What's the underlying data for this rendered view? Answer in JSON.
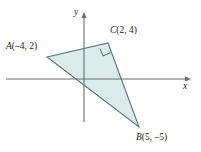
{
  "figure": {
    "kind": "coordinate-plane-triangle",
    "background_color": "#ffffff",
    "axes": {
      "x_axis_label": "x",
      "y_axis_label": "y",
      "axis_color": "#6d6e71",
      "origin_px": {
        "x": 84,
        "y": 79
      },
      "x_axis_span_px": {
        "from": 6,
        "to": 190
      },
      "y_axis_span_px": {
        "from": 13,
        "to": 122
      },
      "x_arrow": "right",
      "y_arrow": "up",
      "units_per_pixel": {
        "x": 9.25,
        "y": 9.25
      },
      "ticks_shown": false,
      "grid_shown": false
    },
    "polygon": {
      "name": "triangle-ABC",
      "fill_color": "#d9ecea",
      "stroke_color": "#5c7382",
      "stroke_width": 1.1,
      "right_angle_at": "C"
    },
    "right_angle_marker": {
      "vertex": "C",
      "size_px": 8,
      "stroke_color": "#5c7382"
    },
    "points": [
      {
        "id": "A",
        "letter": "A",
        "coords_text": "(–4, 2)",
        "label_text": "A(–4, 2)",
        "x": -4,
        "y": 2,
        "px": {
          "x": 47,
          "y": 57
        },
        "label_px": {
          "x": 6,
          "y": 42
        }
      },
      {
        "id": "C",
        "letter": "C",
        "coords_text": "(2, 4)",
        "label_text": "C(2, 4)",
        "x": 2,
        "y": 4,
        "px": {
          "x": 108,
          "y": 43
        },
        "label_px": {
          "x": 110,
          "y": 26
        }
      },
      {
        "id": "B",
        "letter": "B",
        "coords_text": "(5, –5)",
        "label_text": "B(5, –5)",
        "x": 5,
        "y": -5,
        "px": {
          "x": 139,
          "y": 127
        },
        "label_px": {
          "x": 136,
          "y": 133
        }
      }
    ]
  }
}
